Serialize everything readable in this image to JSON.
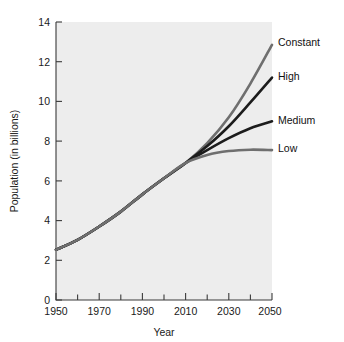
{
  "chart_data": {
    "type": "line",
    "title": "",
    "xlabel": "Year",
    "ylabel": "Population (in billions)",
    "xlim": [
      1950,
      2050
    ],
    "ylim": [
      0,
      14
    ],
    "grid": false,
    "legend_position": "right-inline-labels",
    "x_major_ticks": [
      1950,
      1970,
      1990,
      2010,
      2030,
      2050
    ],
    "x_major_tick_labels": [
      "1950",
      "1970",
      "1990",
      "2010",
      "2030",
      "2050"
    ],
    "x_minor_ticks": [
      1960,
      1980,
      2000,
      2020,
      2040
    ],
    "y_ticks": [
      0,
      2,
      4,
      6,
      8,
      10,
      12,
      14
    ],
    "y_tick_labels": [
      "0",
      "2",
      "4",
      "6",
      "8",
      "10",
      "12",
      "14"
    ],
    "x": [
      1950,
      1960,
      1970,
      1980,
      1990,
      2000,
      2010,
      2020,
      2030,
      2040,
      2050
    ],
    "series": [
      {
        "name": "Constant",
        "color": "#6f6f6f",
        "width": 2.6,
        "values": [
          2.53,
          3.03,
          3.7,
          4.45,
          5.32,
          6.13,
          6.9,
          7.9,
          9.2,
          10.9,
          12.85
        ]
      },
      {
        "name": "High",
        "color": "#1c1c1c",
        "width": 2.6,
        "values": [
          2.53,
          3.03,
          3.7,
          4.45,
          5.32,
          6.13,
          6.9,
          7.75,
          8.75,
          9.95,
          11.2
        ]
      },
      {
        "name": "Medium",
        "color": "#1c1c1c",
        "width": 2.6,
        "values": [
          2.53,
          3.03,
          3.7,
          4.45,
          5.32,
          6.13,
          6.9,
          7.55,
          8.15,
          8.65,
          9.0
        ]
      },
      {
        "name": "Low",
        "color": "#6f6f6f",
        "width": 2.6,
        "values": [
          2.53,
          3.03,
          3.7,
          4.45,
          5.32,
          6.13,
          6.9,
          7.3,
          7.5,
          7.57,
          7.55
        ]
      }
    ]
  },
  "axes": {
    "x_title": "Year",
    "y_title": "Population (in billions)"
  },
  "series_labels": {
    "constant": "Constant",
    "high": "High",
    "medium": "Medium",
    "low": "Low"
  },
  "colors": {
    "plot_background": "#ededed",
    "page_background": "#ffffff",
    "axis": "#3a3a3a",
    "dark_curve": "#1c1c1c",
    "gray_curve": "#6f6f6f",
    "text": "#1a1a1a"
  },
  "y_tick_labels": {
    "t0": "0",
    "t2": "2",
    "t4": "4",
    "t6": "6",
    "t8": "8",
    "t10": "10",
    "t12": "12",
    "t14": "14"
  },
  "x_tick_labels": {
    "t1950": "1950",
    "t1970": "1970",
    "t1990": "1990",
    "t2010": "2010",
    "t2030": "2030",
    "t2050": "2050"
  }
}
